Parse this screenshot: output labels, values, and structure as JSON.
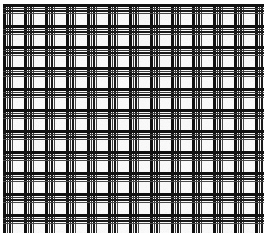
{
  "image": {
    "kind": "woven-plaid-texture",
    "width": 267,
    "height": 243,
    "background_color": "#fdfdfd",
    "margins": {
      "top": 4,
      "right": 3,
      "bottom": 10,
      "left": 3
    },
    "alt_text": "Black and white woven grid plaid texture"
  },
  "pattern": {
    "name": "plaid-weave",
    "repeat_x": 21,
    "repeat_y": 21,
    "orientation": "orthogonal",
    "thread_color_dark": "#111111",
    "thread_color_mid": "#3a3a3a",
    "thread_color_light": "#6b6b6b",
    "gap_color": "#ffffff",
    "vertical_bands": [
      {
        "offset": 0,
        "width": 3,
        "color": "#111111"
      },
      {
        "offset": 4,
        "width": 1,
        "color": "#3a3a3a"
      },
      {
        "offset": 6,
        "width": 2,
        "color": "#1a1a1a"
      },
      {
        "offset": 9,
        "width": 1,
        "color": "#4a4a4a"
      }
    ],
    "horizontal_bands": [
      {
        "offset": 0,
        "width": 3,
        "color": "#111111"
      },
      {
        "offset": 4,
        "width": 1,
        "color": "#3a3a3a"
      },
      {
        "offset": 6,
        "width": 2,
        "color": "#1a1a1a"
      },
      {
        "offset": 9,
        "width": 1,
        "color": "#4a4a4a"
      }
    ],
    "cell_gap_px": 10,
    "line_count_vertical": 13,
    "line_count_horizontal": 12
  },
  "chart_data": {
    "type": "heatmap",
    "title": "",
    "xlabel": "",
    "ylabel": "",
    "grid": true,
    "legend": "none"
  }
}
